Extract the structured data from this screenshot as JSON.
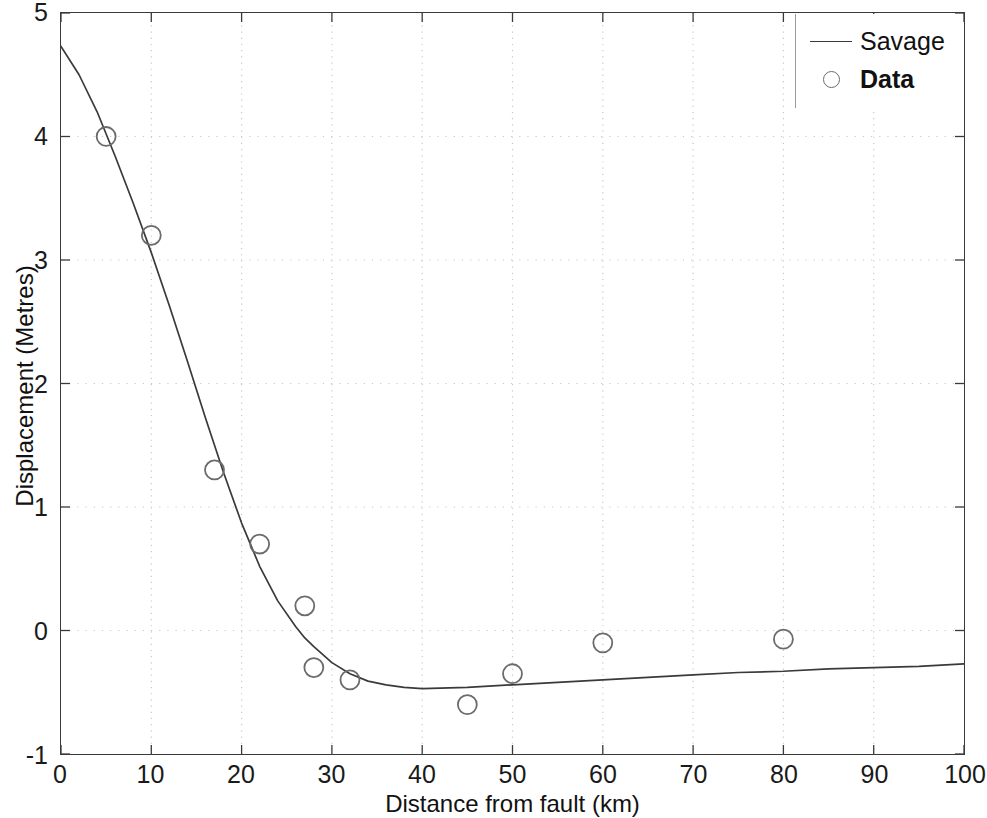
{
  "chart_data": {
    "type": "scatter",
    "title": "",
    "xlabel": "Distance from fault (km)",
    "ylabel": "Displacement (Metres)",
    "xlim": [
      0,
      100
    ],
    "ylim": [
      -1,
      5
    ],
    "xticks": [
      0,
      10,
      20,
      30,
      40,
      50,
      60,
      70,
      80,
      90,
      100
    ],
    "yticks": [
      -1,
      0,
      1,
      2,
      3,
      4,
      5
    ],
    "xtick_labels": [
      "0",
      "10",
      "20",
      "30",
      "40",
      "50",
      "60",
      "70",
      "80",
      "90",
      "100"
    ],
    "ytick_labels": [
      "-1",
      "0",
      "1",
      "2",
      "3",
      "4",
      "5"
    ],
    "grid": true,
    "grid_style": "dotted",
    "grid_color": "#c8c8c8",
    "legend_position": "top-right",
    "series": [
      {
        "name": "Savage",
        "type": "line",
        "style": "solid",
        "color": "#3a3a3a",
        "x": [
          0,
          2,
          4,
          5,
          6,
          8,
          10,
          12,
          14,
          16,
          17,
          18,
          20,
          22,
          24,
          26,
          27,
          28,
          30,
          32,
          34,
          36,
          38,
          40,
          45,
          50,
          55,
          60,
          65,
          70,
          75,
          80,
          85,
          90,
          95,
          100
        ],
        "y": [
          4.73,
          4.5,
          4.2,
          4.02,
          3.84,
          3.46,
          3.06,
          2.63,
          2.18,
          1.72,
          1.5,
          1.28,
          0.87,
          0.52,
          0.24,
          0.03,
          -0.06,
          -0.13,
          -0.26,
          -0.35,
          -0.41,
          -0.44,
          -0.46,
          -0.47,
          -0.46,
          -0.44,
          -0.42,
          -0.4,
          -0.38,
          -0.36,
          -0.34,
          -0.33,
          -0.31,
          -0.3,
          -0.29,
          -0.27
        ]
      },
      {
        "name": "Data",
        "type": "scatter",
        "marker": "circle-open",
        "color": "#6b6b6b",
        "x": [
          5,
          10,
          17,
          22,
          27,
          28,
          32,
          45,
          50,
          60,
          80
        ],
        "y": [
          4.0,
          3.2,
          1.3,
          0.7,
          0.2,
          -0.3,
          -0.4,
          -0.6,
          -0.35,
          -0.1,
          -0.07
        ]
      }
    ]
  },
  "legend": {
    "entries": [
      {
        "label": "Savage",
        "marker": "line",
        "bold": false
      },
      {
        "label": "Data",
        "marker": "circle-open",
        "bold": true
      }
    ]
  }
}
